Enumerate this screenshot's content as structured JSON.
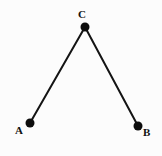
{
  "figure": {
    "kind": "geometry-diagram",
    "background_color": "#fcfcfc",
    "stroke_color": "#141414",
    "stroke_width": 2,
    "dot_color": "#0d0d0d",
    "dot_radius": 4.5,
    "label_color": "#111111",
    "width": 162,
    "height": 156
  },
  "points": [
    {
      "id": "A",
      "label": "A",
      "x": 30,
      "y": 123,
      "label_x": 15,
      "label_y": 125
    },
    {
      "id": "B",
      "label": "B",
      "x": 138,
      "y": 126,
      "label_x": 143,
      "label_y": 127
    },
    {
      "id": "C",
      "label": "C",
      "x": 85,
      "y": 27,
      "label_x": 78,
      "label_y": 9
    }
  ],
  "segments": [
    {
      "id": "AC",
      "from": "A",
      "to": "C",
      "x1": 30,
      "y1": 123,
      "x2": 85,
      "y2": 27
    },
    {
      "id": "CB",
      "from": "C",
      "to": "B",
      "x1": 85,
      "y1": 27,
      "x2": 138,
      "y2": 126
    }
  ]
}
